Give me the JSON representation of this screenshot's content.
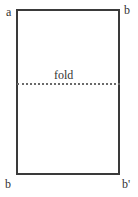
{
  "diagram": {
    "type": "folded-paper-rectangle",
    "labels": {
      "top_left": "a",
      "top_right": "b",
      "bottom_left": "b",
      "bottom_right": "b'",
      "fold": "fold"
    },
    "colors": {
      "outline": "#3a3a3a",
      "fold_line": "#6a6a6a",
      "text": "#333333",
      "background": "#ffffff"
    }
  }
}
